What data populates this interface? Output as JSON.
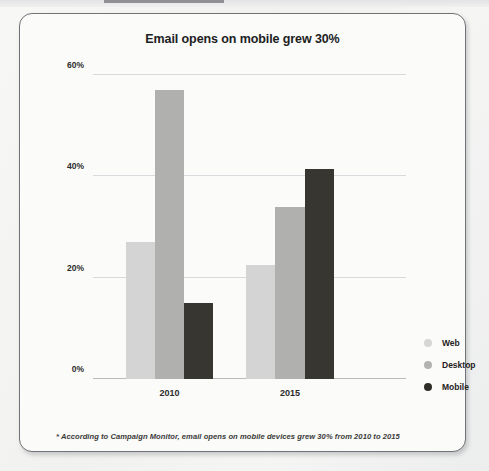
{
  "card": {
    "title": "Email opens on mobile grew 30%",
    "footnote": "* According to Campaign Monitor, email opens on mobile devices grew 30% from 2010 to 2015"
  },
  "legend": {
    "position": "right",
    "items": [
      {
        "label": "Web",
        "color": "#d5d6d5",
        "marker": "legend-dot-web"
      },
      {
        "label": "Desktop",
        "color": "#b2b3b1",
        "marker": "legend-dot-desktop"
      },
      {
        "label": "Mobile",
        "color": "#2f2d28",
        "marker": "legend-dot-mobile"
      }
    ]
  },
  "axis": {
    "y_ticks": [
      "0%",
      "20%",
      "40%",
      "60%"
    ],
    "x_ticks": [
      "2010",
      "2015"
    ]
  },
  "chart_data": {
    "type": "bar",
    "title": "Email opens on mobile grew 30%",
    "subtitle": "",
    "xlabel": "",
    "ylabel": "",
    "categories": [
      "2010",
      "2015"
    ],
    "series": [
      {
        "name": "Web",
        "color": "#d3d4d3",
        "values": [
          27,
          22.5
        ]
      },
      {
        "name": "Desktop",
        "color": "#b0b1af",
        "values": [
          57,
          34
        ]
      },
      {
        "name": "Mobile",
        "color": "#383630",
        "values": [
          15,
          41.5
        ]
      }
    ],
    "ylim": [
      0,
      60
    ],
    "ytick_values": [
      0,
      20,
      40,
      60
    ],
    "ytick_labels": [
      "0%",
      "20%",
      "40%",
      "60%"
    ],
    "value_format": "percent",
    "grid": true,
    "legend_position": "right",
    "annotations": [
      "* According to Campaign Monitor, email opens on mobile devices grew 30% from 2010 to 2015"
    ]
  }
}
